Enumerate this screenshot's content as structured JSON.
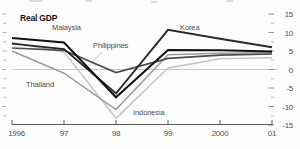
{
  "chart_data": {
    "type": "line",
    "title": "Real GDP",
    "x": [
      "1996",
      "97",
      "98",
      "99",
      "2000",
      "01"
    ],
    "y_ticks": [
      15,
      10,
      5,
      0,
      -5,
      -10,
      -15
    ],
    "ylim": [
      -15,
      15
    ],
    "grid": "zero-line-only",
    "legend_position": "inline-labels",
    "series": [
      {
        "name": "Indonesia",
        "color": "#c4c4c4",
        "width": 1.5,
        "values": [
          7.3,
          4.7,
          -13.2,
          0.4,
          2.9,
          3.2
        ]
      },
      {
        "name": "Thailand",
        "color": "#9b9b9b",
        "width": 1.5,
        "values": [
          5.0,
          -1.0,
          -10.8,
          4.0,
          4.4,
          4.5
        ]
      },
      {
        "name": "Philippines",
        "color": "#4d4d4d",
        "width": 1.7,
        "values": [
          5.8,
          5.2,
          -0.8,
          3.0,
          3.9,
          4.2
        ]
      },
      {
        "name": "Korea",
        "color": "#2a2a2a",
        "width": 1.9,
        "values": [
          7.0,
          5.5,
          -6.5,
          10.7,
          8.3,
          6.0
        ]
      },
      {
        "name": "Malaysia",
        "color": "#121212",
        "width": 2.0,
        "values": [
          8.5,
          7.3,
          -7.5,
          5.3,
          5.2,
          4.9
        ]
      }
    ],
    "colors": {
      "axis": "#5a5a5a",
      "zero_line": "#c8c8c8",
      "tick": "#858585",
      "label": "#4e4e4e"
    }
  }
}
